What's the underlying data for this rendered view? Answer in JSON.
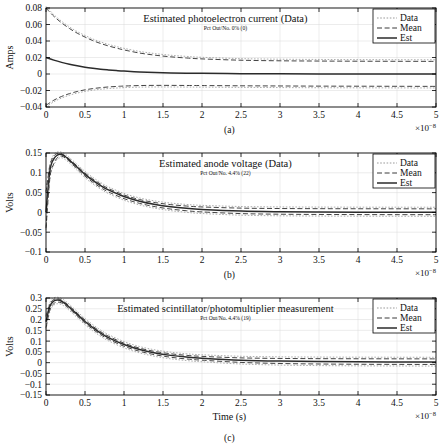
{
  "figure": {
    "xlabel": "Time (s)",
    "x_exponent_base": "×10",
    "x_exponent_power": "−8",
    "panel_labels": [
      "(a)",
      "(b)",
      "(c)"
    ]
  },
  "legend": {
    "items": [
      {
        "label": "Data",
        "style": "dotted",
        "color": "#9a9a9a"
      },
      {
        "label": "Mean",
        "style": "dashed",
        "color": "#3a3a3a"
      },
      {
        "label": "Est",
        "style": "solid",
        "color": "#2b2b2b"
      }
    ]
  },
  "chart_data": [
    {
      "type": "line",
      "panel": "(a)",
      "title": "Estimated photoelectron current (Data)",
      "subtitle": "Pct Out/No. 0% (0)",
      "xlabel": "",
      "ylabel": "Amps",
      "xlim": [
        0,
        5
      ],
      "ylim": [
        -0.04,
        0.08
      ],
      "xticks": [
        0,
        0.5,
        1,
        1.5,
        2,
        2.5,
        3,
        3.5,
        4,
        4.5,
        5
      ],
      "xticklabels": [
        "0",
        "0.5",
        "1",
        "1.5",
        "2",
        "2.5",
        "3",
        "3.5",
        "4",
        "4.5",
        "5"
      ],
      "yticks": [
        -0.04,
        -0.02,
        0,
        0.02,
        0.04,
        0.06,
        0.08
      ],
      "yticklabels": [
        "−0.04",
        "−0.02",
        "0",
        "0.02",
        "0.04",
        "0.06",
        "0.08"
      ],
      "x": [
        0,
        0.1,
        0.2,
        0.3,
        0.4,
        0.5,
        0.6,
        0.7,
        0.8,
        0.9,
        1.0,
        1.2,
        1.4,
        1.6,
        1.8,
        2.0,
        2.5,
        3.0,
        3.5,
        4.0,
        4.5,
        5.0
      ],
      "series": [
        {
          "name": "Mean",
          "role": "upper-bound",
          "values": [
            0.08,
            0.07,
            0.062,
            0.0552,
            0.0495,
            0.0448,
            0.0405,
            0.037,
            0.034,
            0.0315,
            0.0292,
            0.0254,
            0.0228,
            0.0208,
            0.0194,
            0.0183,
            0.0167,
            0.016,
            0.0157,
            0.0155,
            0.0154,
            0.0153
          ]
        },
        {
          "name": "Est",
          "role": "estimate",
          "values": [
            0.02,
            0.0168,
            0.0141,
            0.0118,
            0.0099,
            0.0083,
            0.007,
            0.0059,
            0.005,
            0.0042,
            0.0035,
            0.0025,
            0.0018,
            0.0013,
            0.001,
            0.0008,
            0.0004,
            0.0002,
            0.0001,
            0.0001,
            0.0,
            0.0
          ]
        },
        {
          "name": "Mean",
          "role": "lower-bound",
          "values": [
            -0.038,
            -0.0318,
            -0.0272,
            -0.0238,
            -0.0212,
            -0.0192,
            -0.0177,
            -0.0166,
            -0.0157,
            -0.0151,
            -0.0146,
            -0.014,
            -0.0138,
            -0.0138,
            -0.0139,
            -0.014,
            -0.0143,
            -0.0145,
            -0.0147,
            -0.0148,
            -0.0149,
            -0.015
          ]
        }
      ]
    },
    {
      "type": "line",
      "panel": "(b)",
      "title": "Estimated anode voltage (Data)",
      "subtitle": "Pct Out/No. 4.4% (22)",
      "xlabel": "",
      "ylabel": "Volts",
      "xlim": [
        0,
        5
      ],
      "ylim": [
        -0.1,
        0.15
      ],
      "xticks": [
        0,
        0.5,
        1,
        1.5,
        2,
        2.5,
        3,
        3.5,
        4,
        4.5,
        5
      ],
      "xticklabels": [
        "0",
        "0.5",
        "1",
        "1.5",
        "2",
        "2.5",
        "3",
        "3.5",
        "4",
        "4.5",
        "5"
      ],
      "yticks": [
        -0.1,
        -0.05,
        0,
        0.05,
        0.1,
        0.15
      ],
      "yticklabels": [
        "−0.1",
        "−0.05",
        "0",
        "0.05",
        "0.1",
        "0.15"
      ],
      "x": [
        0,
        0.05,
        0.1,
        0.15,
        0.2,
        0.25,
        0.3,
        0.4,
        0.5,
        0.6,
        0.7,
        0.8,
        1.0,
        1.2,
        1.4,
        1.6,
        1.8,
        2.0,
        2.5,
        3.0,
        3.5,
        4.0,
        4.5,
        5.0
      ],
      "series": [
        {
          "name": "Mean",
          "role": "upper-bound",
          "values": [
            0.05,
            0.118,
            0.142,
            0.149,
            0.148,
            0.1425,
            0.1345,
            0.117,
            0.0995,
            0.0845,
            0.0715,
            0.0605,
            0.044,
            0.0325,
            0.0248,
            0.0196,
            0.0161,
            0.0138,
            0.0108,
            0.0098,
            0.0094,
            0.0092,
            0.0091,
            0.009
          ]
        },
        {
          "name": "Est",
          "role": "estimate",
          "values": [
            0.0,
            0.105,
            0.135,
            0.1455,
            0.146,
            0.1405,
            0.132,
            0.114,
            0.096,
            0.0808,
            0.0678,
            0.0568,
            0.04,
            0.0282,
            0.02,
            0.0142,
            0.0102,
            0.0074,
            0.0034,
            0.0017,
            0.0009,
            0.0005,
            0.0003,
            0.0002
          ]
        },
        {
          "name": "Mean",
          "role": "lower-bound",
          "values": [
            -0.04,
            0.088,
            0.123,
            0.139,
            0.142,
            0.137,
            0.1285,
            0.11,
            0.0915,
            0.076,
            0.0628,
            0.0518,
            0.0348,
            0.0228,
            0.0144,
            0.0084,
            0.0042,
            0.0012,
            -0.003,
            -0.0046,
            -0.0052,
            -0.0055,
            -0.0057,
            -0.0058
          ]
        }
      ]
    },
    {
      "type": "line",
      "panel": "(c)",
      "title": "Estimated scintillator/photomultiplier measurement",
      "subtitle": "Pct Out/No. 4.4% (19)",
      "xlabel": "Time (s)",
      "ylabel": "Volts",
      "xlim": [
        0,
        5
      ],
      "ylim": [
        -0.15,
        0.3
      ],
      "xticks": [
        0,
        0.5,
        1,
        1.5,
        2,
        2.5,
        3,
        3.5,
        4,
        4.5,
        5
      ],
      "xticklabels": [
        "0",
        "0.5",
        "1",
        "1.5",
        "2",
        "2.5",
        "3",
        "3.5",
        "4",
        "4.5",
        "5"
      ],
      "yticks": [
        -0.15,
        -0.1,
        -0.05,
        0,
        0.05,
        0.1,
        0.15,
        0.2,
        0.25,
        0.3
      ],
      "yticklabels": [
        "−0.15",
        "−0.1",
        "−0.05",
        "0",
        "0.05",
        "0.1",
        "0.15",
        "0.2",
        "0.25",
        "0.3"
      ],
      "x": [
        0,
        0.05,
        0.1,
        0.15,
        0.2,
        0.25,
        0.3,
        0.4,
        0.5,
        0.6,
        0.7,
        0.8,
        1.0,
        1.2,
        1.4,
        1.6,
        1.8,
        2.0,
        2.5,
        3.0,
        3.5,
        4.0,
        4.5,
        5.0
      ],
      "series": [
        {
          "name": "Mean",
          "role": "upper-bound",
          "values": [
            0.215,
            0.272,
            0.293,
            0.296,
            0.29,
            0.278,
            0.263,
            0.23,
            0.1975,
            0.169,
            0.144,
            0.123,
            0.0905,
            0.0675,
            0.0518,
            0.0412,
            0.034,
            0.0292,
            0.0222,
            0.0196,
            0.0186,
            0.0181,
            0.0178,
            0.0176
          ]
        },
        {
          "name": "Est",
          "role": "estimate",
          "values": [
            0.19,
            0.262,
            0.286,
            0.2905,
            0.285,
            0.2725,
            0.257,
            0.224,
            0.191,
            0.1625,
            0.1375,
            0.1165,
            0.084,
            0.0608,
            0.0448,
            0.0338,
            0.0262,
            0.0208,
            0.0116,
            0.0072,
            0.005,
            0.0038,
            0.0032,
            0.0028
          ]
        },
        {
          "name": "Mean",
          "role": "lower-bound",
          "values": [
            0.162,
            0.245,
            0.274,
            0.281,
            0.277,
            0.265,
            0.2495,
            0.2165,
            0.1835,
            0.155,
            0.1298,
            0.1088,
            0.0762,
            0.0528,
            0.0366,
            0.0252,
            0.0172,
            0.0116,
            0.0012,
            -0.0038,
            -0.0062,
            -0.0074,
            -0.008,
            -0.0084
          ]
        }
      ]
    }
  ]
}
